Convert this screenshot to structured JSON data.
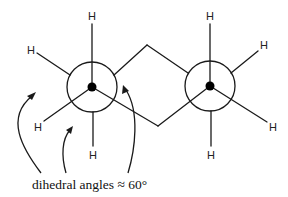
{
  "diagram": {
    "atom_label": "H",
    "caption": "dihedral angles ≈ 60°",
    "colors": {
      "ink": "#1a1a1a",
      "background": "#ffffff"
    },
    "left_newman": {
      "front_substituents": [
        "H",
        "H",
        "ring-bridge"
      ],
      "back_substituents": [
        "H",
        "ring-bridge",
        "H"
      ]
    },
    "right_newman": {
      "front_substituents": [
        "H",
        "H",
        "ring-bridge"
      ],
      "back_substituents": [
        "H",
        "ring-bridge",
        "H"
      ]
    },
    "arrow_count": 3
  }
}
